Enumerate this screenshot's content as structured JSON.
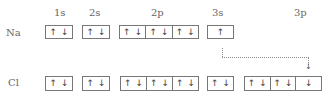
{
  "orbital_headers": [
    "1s",
    "2s",
    "2p",
    "3s",
    "3p"
  ],
  "rows": [
    {
      "element": "Na",
      "orbitals": {
        "1s": [
          [
            "↑",
            "↓"
          ]
        ],
        "2s": [
          [
            "↑",
            "↓"
          ]
        ],
        "2p": [
          [
            "↑",
            "↓"
          ],
          [
            "↑",
            "↓"
          ],
          [
            "↑",
            "↓"
          ]
        ],
        "3s": [
          [
            "↑"
          ]
        ]
      }
    },
    {
      "element": "Cl",
      "orbitals": {
        "1s": [
          [
            "↑",
            "↓"
          ]
        ],
        "2s": [
          [
            "↑",
            "↓"
          ]
        ],
        "2p": [
          [
            "↑",
            "↓"
          ],
          [
            "↑",
            "↓"
          ],
          [
            "↑",
            "↓"
          ]
        ],
        "3s": [
          [
            "↑",
            "↓"
          ]
        ],
        "3p": [
          [
            "↑",
            "↓"
          ],
          [
            "↑",
            "↓"
          ],
          [
            "↓"
          ]
        ]
      }
    }
  ],
  "transfer_arrow": {
    "from": "Na 3s electron",
    "to": "Cl 3p third orbital",
    "style": "dotted",
    "tip": "↓"
  }
}
